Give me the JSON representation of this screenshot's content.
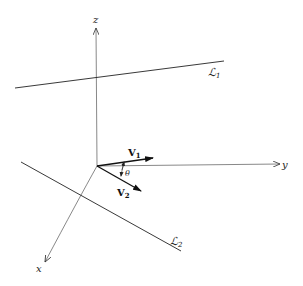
{
  "diagram": {
    "axes": {
      "z": {
        "label": "z"
      },
      "y": {
        "label": "y"
      },
      "x": {
        "label": "x"
      }
    },
    "lines": [
      {
        "name": "L1",
        "label": "ℒ",
        "subscript": "1"
      },
      {
        "name": "L2",
        "label": "ℒ",
        "subscript": "2"
      }
    ],
    "vectors": [
      {
        "name": "V1",
        "label": "V",
        "subscript": "1"
      },
      {
        "name": "V2",
        "label": "V",
        "subscript": "2"
      }
    ],
    "angle": {
      "label": "θ"
    },
    "colors": {
      "stroke": "#222222",
      "background": "#ffffff"
    }
  }
}
